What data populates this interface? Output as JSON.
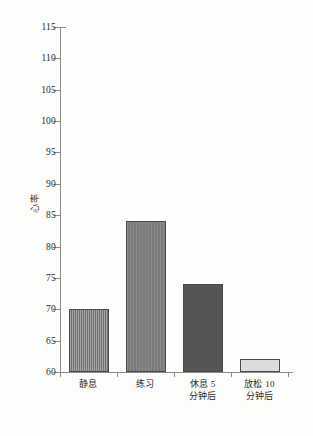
{
  "chart_data": {
    "type": "bar",
    "title": "",
    "xlabel": "",
    "ylabel": "心率",
    "ylim": [
      60,
      115
    ],
    "ytick_step": 5,
    "grid": false,
    "legend": "none",
    "categories": [
      "静息",
      "练习",
      "休息 5\n分钟后",
      "放松 10\n分钟后"
    ],
    "values": [
      70,
      84,
      74,
      62
    ],
    "yticks": [
      60,
      65,
      70,
      75,
      80,
      85,
      90,
      95,
      100,
      105,
      110,
      115
    ],
    "bars": [
      {
        "category": "静息",
        "value": 70,
        "fill_style": "striped",
        "color": "#7d7d7d"
      },
      {
        "category": "练习",
        "value": 84,
        "fill_style": "mid-gray",
        "color": "#7f7f7f"
      },
      {
        "category": "休息 5\n分钟后",
        "value": 74,
        "fill_style": "dark-gray",
        "color": "#555555"
      },
      {
        "category": "放松 10\n分钟后",
        "value": 62,
        "fill_style": "light-gray",
        "color": "#dcdcdc"
      }
    ]
  },
  "axis": {
    "background_color": "#fdfdfc",
    "line_color": "#8b8b8b",
    "text_color": "#2b2b2b"
  }
}
